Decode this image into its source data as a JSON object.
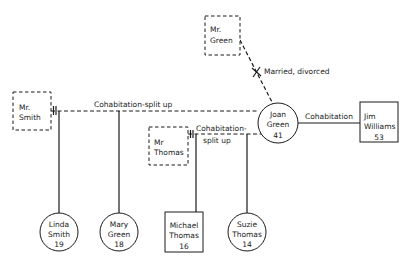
{
  "diagram": {
    "type": "genogram",
    "nodes": {
      "mr_green": {
        "line1": "Mr.",
        "line2": "Green",
        "age": "",
        "shape": "square-dashed"
      },
      "mr_smith": {
        "line1": "Mr.",
        "line2": "Smith",
        "age": "",
        "shape": "square-dashed"
      },
      "mr_thomas": {
        "line1": "Mr",
        "line2": "Thomas",
        "age": "",
        "shape": "square-dashed"
      },
      "joan_green": {
        "line1": "Joan",
        "line2": "Green",
        "age": "41",
        "shape": "circle"
      },
      "jim_williams": {
        "line1": "Jim",
        "line2": "Williams",
        "age": "53",
        "shape": "square"
      },
      "linda_smith": {
        "line1": "Linda",
        "line2": "Smith",
        "age": "19",
        "shape": "circle"
      },
      "mary_green": {
        "line1": "Mary",
        "line2": "Green",
        "age": "18",
        "shape": "circle"
      },
      "michael_thomas": {
        "line1": "Michael",
        "line2": "Thomas",
        "age": "16",
        "shape": "square"
      },
      "suzie_thomas": {
        "line1": "Suzie",
        "line2": "Thomas",
        "age": "14",
        "shape": "circle"
      }
    },
    "relationships": {
      "green_joan": {
        "label": "Married, divorced",
        "style": "dashed-crossed"
      },
      "smith_joan": {
        "label": "Cohabitation-split up",
        "style": "dashed-split"
      },
      "thomas_joan": {
        "label_line1": "Cohabitation-",
        "label_line2": "split up",
        "style": "dashed-split"
      },
      "joan_jim": {
        "label": "Cohabitation",
        "style": "solid"
      }
    },
    "colors": {
      "ink": "#1a1a1a",
      "background": "#ffffff"
    }
  }
}
